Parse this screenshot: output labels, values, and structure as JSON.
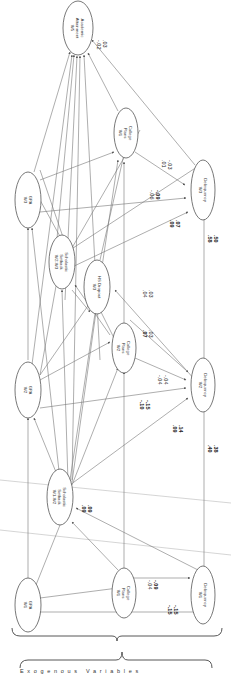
{
  "diagram": {
    "nodes": [
      {
        "id": "acad_w5",
        "lines": [
          "Academic",
          "Attainment",
          "W5"
        ]
      },
      {
        "id": "college_w1_top",
        "lines": [
          "College",
          "Plans",
          "W1"
        ]
      },
      {
        "id": "delinq_w3",
        "lines": [
          "Delinquency",
          "W3"
        ]
      },
      {
        "id": "gpa_w3",
        "lines": [
          "GPA",
          "W3"
        ]
      },
      {
        "id": "setback_w2w3",
        "lines": [
          "Scholastic",
          "Setback",
          "W2-W3"
        ]
      },
      {
        "id": "dropout_w3",
        "lines": [
          "HS Dropout",
          "W3"
        ]
      },
      {
        "id": "college_w2",
        "lines": [
          "College",
          "Plans",
          "W2"
        ]
      },
      {
        "id": "gpa_w2",
        "lines": [
          "GPA",
          "W2"
        ]
      },
      {
        "id": "delinq_w2",
        "lines": [
          "Delinquency",
          "W2"
        ]
      },
      {
        "id": "setback_w1w2",
        "lines": [
          "Scholastic",
          "Setback",
          "W1-W2"
        ]
      },
      {
        "id": "gpa_w1",
        "lines": [
          "GPA",
          "W1"
        ]
      },
      {
        "id": "college_w1",
        "lines": [
          "College",
          "Plans",
          "W1"
        ]
      },
      {
        "id": "delinq_w1",
        "lines": [
          "Delinquency",
          "W1"
        ]
      }
    ],
    "coefficients": [
      {
        "id": "c_acad",
        "top": "-.02",
        "bottom": ".03",
        "bold_top": false,
        "bold_bottom": false
      },
      {
        "id": "c_cp_d3",
        "top": ".01",
        "bottom": "-.03",
        "bold_top": false,
        "bold_bottom": false
      },
      {
        "id": "c_gpa3_d3",
        "top": "-.06",
        "bottom": "-.09",
        "bold_top": false,
        "bold_bottom": true
      },
      {
        "id": "c_ss_d3",
        "top": ".09",
        "bottom": ".07",
        "bold_top": true,
        "bold_bottom": true
      },
      {
        "id": "c_d2_d3",
        "top": ".58",
        "bottom": ".50",
        "bold_top": true,
        "bold_bottom": true
      },
      {
        "id": "c_do",
        "top": ".04",
        "bottom": ".03",
        "bold_top": false,
        "bold_bottom": false
      },
      {
        "id": "c_cp2",
        "top": ".07",
        "bottom": ".03",
        "bold_top": true,
        "bold_bottom": false
      },
      {
        "id": "c_cp2_d2",
        "top": "-.04",
        "bottom": "-.04",
        "bold_top": false,
        "bold_bottom": false
      },
      {
        "id": "c_gpa2_d2",
        "top": "-.10",
        "bottom": "-.15",
        "bold_top": true,
        "bold_bottom": true
      },
      {
        "id": "c_ss_d2",
        "top": ".09",
        "bottom": ".14",
        "bold_top": true,
        "bold_bottom": true
      },
      {
        "id": "c_d1_d2",
        "top": ".40",
        "bottom": ".38",
        "bold_top": true,
        "bold_bottom": true
      },
      {
        "id": "c_d1_ss",
        "top": ".09",
        "bottom": ".09",
        "bold_top": true,
        "bold_bottom": true
      },
      {
        "id": "c_cp1_d1",
        "top": "-.04",
        "bottom": "-.09",
        "bold_top": false,
        "bold_bottom": true
      },
      {
        "id": "c_gpa1_d1",
        "top": "-.15",
        "bottom": "-.15",
        "bold_top": true,
        "bold_bottom": true
      }
    ],
    "exogenous_label": "Exogenous Variables"
  }
}
